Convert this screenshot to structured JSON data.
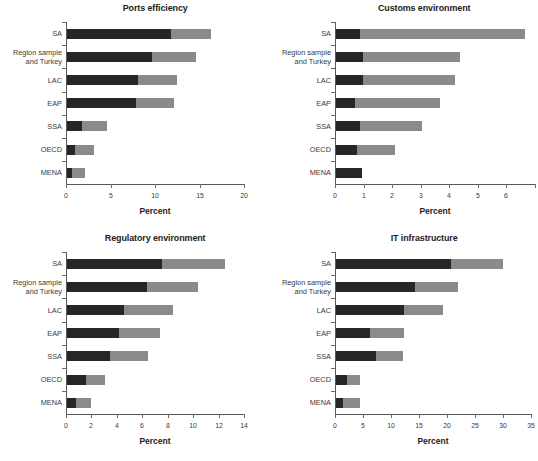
{
  "figure": {
    "series_names": [
      "Segment A (dark)",
      "Segment B (light)"
    ],
    "colors": {
      "dark": "#262626",
      "light": "#8a8a8a",
      "axis": "#5a5a5a",
      "text": "#3a3a3a"
    },
    "categories": [
      "SA",
      "Region sample\nand Turkey",
      "LAC",
      "EAP",
      "SSA",
      "OECD",
      "MENA"
    ],
    "axis_title": "Percent"
  },
  "chart_data": [
    {
      "type": "bar",
      "orientation": "horizontal",
      "stacked": true,
      "title": "Ports efficiency",
      "xlabel": "Percent",
      "ylabel": "",
      "categories": [
        "SA",
        "Region sample and Turkey",
        "LAC",
        "EAP",
        "SSA",
        "OECD",
        "MENA"
      ],
      "xlim": [
        0,
        20
      ],
      "xticks": [
        0,
        5,
        10,
        15,
        20
      ],
      "xticklabels": [
        "0",
        "5",
        "10",
        "15",
        "20"
      ],
      "grid": false,
      "legend": "none",
      "series": [
        {
          "name": "Segment A (dark)",
          "values": [
            11.7,
            9.6,
            8.0,
            7.8,
            1.7,
            0.9,
            0.6
          ]
        },
        {
          "name": "Segment B (light)",
          "values": [
            4.5,
            4.9,
            4.4,
            4.2,
            2.8,
            2.1,
            1.4
          ]
        }
      ],
      "totals": [
        16.2,
        14.5,
        12.4,
        12.0,
        4.5,
        3.0,
        2.0
      ]
    },
    {
      "type": "bar",
      "orientation": "horizontal",
      "stacked": true,
      "title": "Customs environment",
      "xlabel": "Percent",
      "ylabel": "",
      "categories": [
        "SA",
        "Region sample and Turkey",
        "LAC",
        "EAP",
        "SSA",
        "OECD",
        "MENA"
      ],
      "xlim": [
        0,
        7
      ],
      "xticks": [
        0,
        1,
        2,
        3,
        4,
        5,
        6,
        7
      ],
      "xticklabels": [
        "0",
        "1",
        "2",
        "3",
        "4",
        "5",
        "6",
        ""
      ],
      "grid": false,
      "legend": "none",
      "series": [
        {
          "name": "Segment A (dark)",
          "values": [
            0.85,
            0.95,
            0.95,
            0.65,
            0.85,
            0.72,
            0.9
          ]
        },
        {
          "name": "Segment B (light)",
          "values": [
            5.75,
            3.4,
            3.2,
            3.0,
            2.15,
            1.33,
            0.0
          ]
        }
      ],
      "totals": [
        6.6,
        4.35,
        4.15,
        3.65,
        3.0,
        2.05,
        0.9
      ]
    },
    {
      "type": "bar",
      "orientation": "horizontal",
      "stacked": true,
      "title": "Regulatory environment",
      "xlabel": "Percent",
      "ylabel": "",
      "categories": [
        "SA",
        "Region sample and Turkey",
        "LAC",
        "EAP",
        "SSA",
        "OECD",
        "MENA"
      ],
      "xlim": [
        0,
        14
      ],
      "xticks": [
        0,
        2,
        4,
        6,
        8,
        10,
        12,
        14
      ],
      "xticklabels": [
        "0",
        "2",
        "4",
        "6",
        "8",
        "10",
        "12",
        "14"
      ],
      "grid": false,
      "legend": "none",
      "series": [
        {
          "name": "Segment A (dark)",
          "values": [
            7.5,
            6.3,
            4.5,
            4.1,
            3.4,
            1.5,
            0.7
          ]
        },
        {
          "name": "Segment B (light)",
          "values": [
            4.9,
            4.0,
            3.85,
            3.2,
            3.0,
            1.5,
            1.2
          ]
        }
      ],
      "totals": [
        12.4,
        10.3,
        8.35,
        7.3,
        6.4,
        3.0,
        1.9
      ]
    },
    {
      "type": "bar",
      "orientation": "horizontal",
      "stacked": true,
      "title": "IT infrastructure",
      "xlabel": "Percent",
      "ylabel": "",
      "categories": [
        "SA",
        "Region sample and Turkey",
        "LAC",
        "EAP",
        "SSA",
        "OECD",
        "MENA"
      ],
      "xlim": [
        0,
        35
      ],
      "xticks": [
        0,
        5,
        10,
        15,
        20,
        25,
        30,
        35
      ],
      "xticklabels": [
        "0",
        "5",
        "10",
        "15",
        "20",
        "25",
        "30",
        "35"
      ],
      "grid": false,
      "legend": "none",
      "series": [
        {
          "name": "Segment A (dark)",
          "values": [
            20.5,
            14.1,
            12.2,
            6.0,
            7.1,
            1.9,
            1.3
          ]
        },
        {
          "name": "Segment B (light)",
          "values": [
            9.3,
            7.6,
            6.9,
            6.2,
            4.9,
            2.4,
            2.9
          ]
        }
      ],
      "totals": [
        29.8,
        21.7,
        19.1,
        12.2,
        12.0,
        4.3,
        4.2
      ]
    }
  ]
}
